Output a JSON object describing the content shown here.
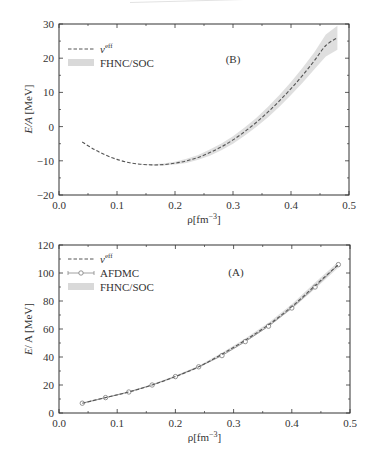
{
  "figure": {
    "panels": [
      "B",
      "A"
    ]
  },
  "chart_data": [
    {
      "panel": "B",
      "panel_label": "(B)",
      "type": "line",
      "title": "",
      "xlabel": "ρ[fm⁻³]",
      "ylabel": "E/A [MeV]",
      "xlim": [
        0.0,
        0.5
      ],
      "ylim": [
        -20,
        30
      ],
      "xticks": [
        "0.0",
        "0.1",
        "0.2",
        "0.3",
        "0.4",
        "0.5"
      ],
      "yticks": [
        "−20",
        "−10",
        "0",
        "10",
        "20",
        "30"
      ],
      "grid": false,
      "legend_position": "upper left",
      "legend": [
        "v^eff",
        "FHNC/SOC"
      ],
      "x": [
        0.04,
        0.06,
        0.08,
        0.1,
        0.12,
        0.14,
        0.16,
        0.18,
        0.2,
        0.22,
        0.24,
        0.26,
        0.28,
        0.3,
        0.32,
        0.34,
        0.36,
        0.38,
        0.4,
        0.42,
        0.44,
        0.46,
        0.48
      ],
      "series": [
        {
          "name": "v^eff",
          "style": "dashed",
          "color": "#555555",
          "values": [
            -4.5,
            -6.6,
            -8.3,
            -9.6,
            -10.5,
            -11.0,
            -11.2,
            -11.1,
            -10.7,
            -10.0,
            -9.0,
            -7.6,
            -5.9,
            -3.9,
            -1.5,
            1.2,
            4.2,
            7.5,
            11.1,
            15.0,
            19.2,
            23.7,
            26.0
          ]
        },
        {
          "name": "FHNC/SOC",
          "style": "band",
          "color": "#d9d9d9",
          "lower": [
            -4.5,
            -6.6,
            -8.3,
            -9.6,
            -10.5,
            -11.1,
            -11.4,
            -11.4,
            -11.1,
            -10.6,
            -9.7,
            -8.5,
            -6.9,
            -5.0,
            -2.7,
            -0.1,
            2.7,
            5.8,
            9.2,
            12.8,
            16.7,
            20.5,
            22.5
          ],
          "upper": [
            -4.5,
            -6.6,
            -8.3,
            -9.6,
            -10.5,
            -10.9,
            -11.0,
            -10.8,
            -10.3,
            -9.4,
            -8.3,
            -6.7,
            -4.9,
            -2.8,
            -0.3,
            2.5,
            5.7,
            9.2,
            13.0,
            17.2,
            21.7,
            26.9,
            29.5
          ]
        }
      ]
    },
    {
      "panel": "A",
      "panel_label": "(A)",
      "type": "line",
      "title": "",
      "xlabel": "ρ[fm⁻³]",
      "ylabel": "E/A [MeV]",
      "xlim": [
        0.0,
        0.5
      ],
      "ylim": [
        0,
        120
      ],
      "xticks": [
        "0.0",
        "0.1",
        "0.2",
        "0.3",
        "0.4",
        "0.5"
      ],
      "yticks": [
        "0",
        "20",
        "40",
        "60",
        "80",
        "100",
        "120"
      ],
      "grid": false,
      "legend_position": "upper left",
      "legend": [
        "v^eff",
        "AFDMC",
        "FHNC/SOC"
      ],
      "x": [
        0.04,
        0.08,
        0.12,
        0.16,
        0.2,
        0.24,
        0.28,
        0.32,
        0.36,
        0.4,
        0.44,
        0.48
      ],
      "series": [
        {
          "name": "v^eff",
          "style": "dashed",
          "color": "#555555",
          "values": [
            7,
            11,
            15,
            20,
            26,
            33,
            42,
            52,
            63,
            76,
            91,
            106
          ]
        },
        {
          "name": "AFDMC",
          "style": "line-open-circle",
          "color": "#888888",
          "values": [
            7,
            11,
            15,
            20,
            26,
            33,
            41,
            51,
            62,
            75,
            90,
            106
          ]
        },
        {
          "name": "FHNC/SOC",
          "style": "band",
          "color": "#d9d9d9",
          "lower": [
            6.5,
            10.5,
            14.5,
            19.5,
            25.3,
            32.2,
            41.0,
            50.8,
            61.6,
            74.3,
            88.8,
            104.0
          ],
          "upper": [
            7.5,
            11.5,
            15.5,
            20.5,
            26.7,
            33.8,
            43.0,
            53.2,
            64.4,
            77.7,
            93.2,
            108.0
          ]
        }
      ]
    }
  ]
}
